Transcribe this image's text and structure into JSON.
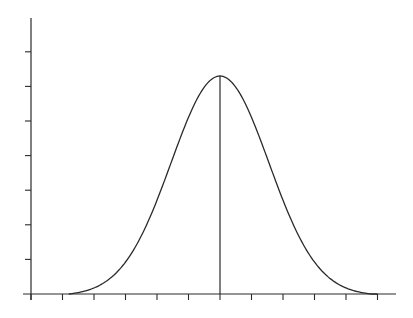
{
  "chart_data": {
    "type": "line",
    "title": "",
    "xlabel": "",
    "ylabel": "",
    "x_ticks": [
      0,
      1,
      2,
      3,
      4,
      5,
      6,
      7,
      8,
      9,
      10,
      11
    ],
    "y_ticks": [
      0,
      1,
      2,
      3,
      4,
      5,
      6,
      7
    ],
    "tick_labels_shown": false,
    "grid": false,
    "legend": null,
    "xlim": [
      0,
      11.5
    ],
    "ylim": [
      0,
      7.9
    ],
    "series": [
      {
        "name": "normal-curve",
        "mean": 6,
        "sd": 1.55,
        "peak": 6.3,
        "support": [
          1.2,
          11
        ]
      }
    ],
    "annotations": [
      {
        "type": "vertical-line",
        "x": 6,
        "from_y": 0,
        "to_y": 6.3,
        "label": "mean"
      }
    ]
  },
  "layout": {
    "origin_px": [
      31,
      294
    ],
    "x_unit_px": 31.5,
    "y_unit_px": 34.6,
    "x_axis_end_px": 396,
    "y_axis_top_px": 18,
    "tick_len_px": 6,
    "color": "#2a2a2a"
  }
}
